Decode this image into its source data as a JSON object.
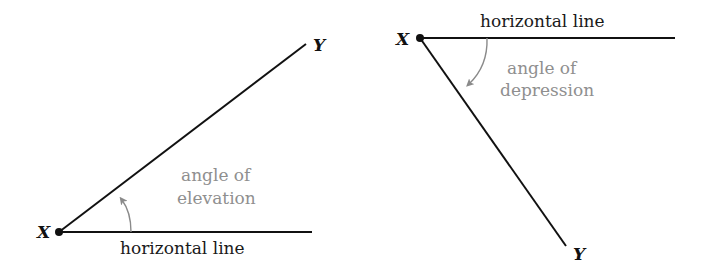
{
  "diagrams": [
    {
      "name": "elevation",
      "point_observer": "X",
      "point_object": "Y",
      "horizontal_label": "horizontal line",
      "angle_label_line1": "angle of",
      "angle_label_line2": "elevation"
    },
    {
      "name": "depression",
      "point_observer": "X",
      "point_object": "Y",
      "horizontal_label": "horizontal line",
      "angle_label_line1": "angle of",
      "angle_label_line2": "depression"
    }
  ],
  "colors": {
    "line": "#111111",
    "angle_text": "#8f8f8f",
    "arrow": "#8a8a8a"
  }
}
